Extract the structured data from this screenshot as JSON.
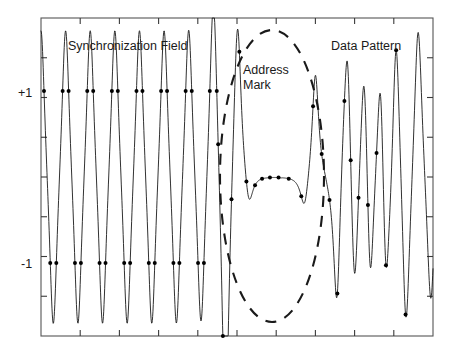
{
  "figure": {
    "title": "",
    "background": "#ffffff",
    "ink": "#1a1a1a"
  },
  "annotations": {
    "sync_field": "Synchronization Field",
    "address_mark_line1": "Address",
    "address_mark_line2": "Mark",
    "data_pattern": "Data Pattern"
  },
  "axis": {
    "y_label_plus": "+1",
    "y_label_minus": "-1",
    "x_tick_count": 10,
    "y_tick_count": 8,
    "frame": {
      "left": 41,
      "top": 18,
      "right": 433,
      "bottom": 336
    }
  },
  "chart_data": {
    "type": "line",
    "xlabel": "",
    "ylabel": "",
    "xlim": [
      0,
      100
    ],
    "ylim": [
      -1.85,
      1.85
    ],
    "grid": false,
    "legend": "none",
    "y_ticks": [
      -1.5,
      -1.0,
      -0.5,
      0.0,
      0.5,
      1.0,
      1.5
    ],
    "y_tick_labels": [
      "",
      "-1",
      "",
      "",
      "",
      "+1",
      ""
    ],
    "series": [
      {
        "name": "readback-signal",
        "style": "solid",
        "color": "#1a1a1a",
        "width": 0.9,
        "x": [
          0.0,
          0.6,
          1.4,
          2.2,
          2.9,
          3.6,
          4.2,
          5.0,
          5.8,
          6.6,
          7.3,
          8.0,
          8.8,
          9.6,
          10.4,
          11.1,
          11.8,
          12.6,
          13.4,
          14.2,
          14.9,
          15.6,
          16.4,
          17.2,
          18.0,
          18.7,
          19.4,
          20.2,
          21.0,
          21.8,
          22.5,
          23.2,
          24.0,
          24.8,
          25.6,
          26.3,
          27.0,
          27.8,
          28.6,
          29.4,
          30.1,
          30.8,
          31.6,
          32.4,
          33.2,
          33.9,
          34.6,
          35.4,
          36.2,
          37.0,
          37.7,
          38.4,
          39.2,
          40.0,
          40.8,
          41.5,
          42.2,
          43.0,
          43.8,
          44.6,
          45.3,
          46.0,
          46.8,
          47.6,
          48.4,
          49.1,
          49.8,
          50.6,
          51.4,
          52.2,
          53.0,
          54.0,
          55.0,
          56.0,
          57.0,
          58.0,
          59.0,
          60.0,
          61.0,
          62.0,
          63.0,
          64.0,
          65.0,
          66.0,
          67.0,
          68.0,
          69.0,
          70.0,
          71.0,
          72.0,
          73.0,
          74.0,
          75.0,
          76.0,
          77.0,
          78.0,
          79.0,
          80.0,
          81.0,
          82.0,
          83.0,
          84.0,
          85.0,
          86.0,
          87.0,
          88.0,
          89.0,
          90.0,
          91.0,
          92.0,
          93.0,
          94.0,
          95.0,
          96.0,
          97.0,
          98.0,
          99.0,
          100.0
        ],
        "comment": "Sampled readback amplitude; sync field is a periodic dibit train, address mark is a long slow transition, data pattern is aperiodic."
      }
    ],
    "sample_points": {
      "name": "equalizer-samples",
      "marker": "dot",
      "color": "#000000",
      "size": 2.0,
      "values_sync_plus": 1.0,
      "values_sync_minus": -1.0,
      "count_approx": 46
    },
    "regions": [
      {
        "label": "Synchronization Field",
        "x_start": 0,
        "x_end": 44
      },
      {
        "label": "Address Mark",
        "x_start": 44,
        "x_end": 74
      },
      {
        "label": "Data Pattern",
        "x_start": 74,
        "x_end": 100
      }
    ],
    "highlight_ellipse": {
      "label": "Address Mark",
      "style": "dashed",
      "cx": 272,
      "cy": 176,
      "rx": 52,
      "ry": 146,
      "color": "#1a1a1a",
      "dash": "11,9",
      "width": 2.1
    }
  }
}
